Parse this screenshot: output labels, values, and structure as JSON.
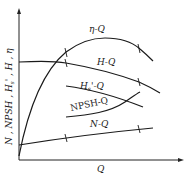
{
  "diagram": {
    "type": "pump performance curves",
    "y_axis_label": "N , NPSH , H_s' , H , η",
    "x_axis_label": "Q",
    "curves": [
      {
        "id": "eta",
        "label": "η-Q"
      },
      {
        "id": "head",
        "label": "H-Q"
      },
      {
        "id": "hs",
        "label": "H_s'-Q"
      },
      {
        "id": "npsh",
        "label": "NPSH-Q"
      },
      {
        "id": "power",
        "label": "N-Q"
      }
    ]
  },
  "labels": {
    "y_axis": "N , NPSH , H",
    "y_axis_sub": "s",
    "y_axis_tail": "' , H , η",
    "x_axis": "Q",
    "eta": "η-Q",
    "head": "H-Q",
    "hs_main": "H",
    "hs_sub": "s",
    "hs_tail": "'-Q",
    "npsh": "NPSH-Q",
    "power": "N-Q"
  },
  "colors": {
    "line": "#1a1a1a",
    "axis": "#222222",
    "background": "#ffffff"
  }
}
